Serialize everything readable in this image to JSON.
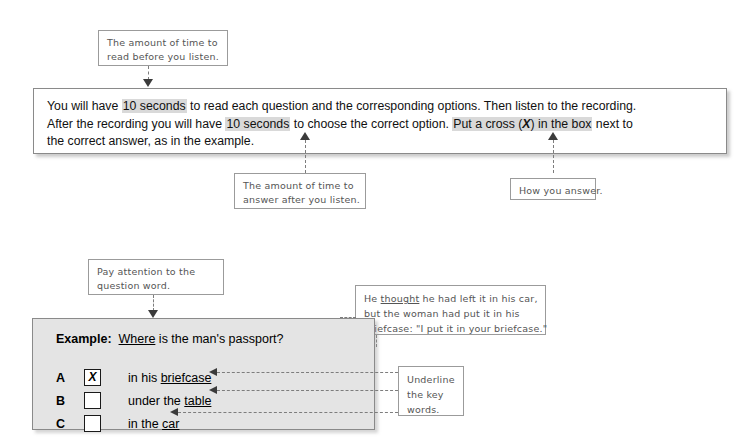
{
  "annotations": {
    "read_time": {
      "line1": "The amount of time to",
      "line2": "read before you listen."
    },
    "answer_time": {
      "line1": "The amount of time to",
      "line2": "answer after you listen."
    },
    "how_you_answer": {
      "line1": "How you answer."
    },
    "question_word": {
      "line1": "Pay attention to the",
      "line2": "question word."
    },
    "underline_keywords": {
      "line1": "Underline",
      "line2": "the key",
      "line3": "words."
    },
    "recording_quote": {
      "line1_a": "He ",
      "line1_underlined": "thought",
      "line1_b": " he had left it in his car,",
      "line2": "but the woman had put it in his",
      "line3": "briefcase: \"I put it in your briefcase.\""
    }
  },
  "instructions": {
    "seg1": "You will have ",
    "hl1": "10 seconds",
    "seg2": " to read each question and the corresponding options. Then listen to the recording.",
    "seg3": "After the recording you will have ",
    "hl2": "10 seconds",
    "seg4": " to choose the correct option. ",
    "hl3_a": "Put a cross (",
    "hl3_x": "X",
    "hl3_b": ") in the box",
    "seg5": " next to",
    "seg6": "the correct answer, as in the example."
  },
  "example": {
    "label": "Example:",
    "question_word": "Where",
    "question_rest": " is the man's passport?",
    "options": [
      {
        "letter": "A",
        "mark": "X",
        "text_before": "in his ",
        "text_underlined": "briefcase",
        "text_after": ""
      },
      {
        "letter": "B",
        "mark": "",
        "text_before": "under the ",
        "text_underlined": "table",
        "text_after": ""
      },
      {
        "letter": "C",
        "mark": "",
        "text_before": "in the ",
        "text_underlined": "car",
        "text_after": ""
      }
    ]
  },
  "colors": {
    "highlight": "#d9d9d9",
    "example_panel_bg": "#e4e4e4",
    "border": "#8a8a8a",
    "callout_text": "#555555",
    "connector": "#7d7d7d"
  }
}
